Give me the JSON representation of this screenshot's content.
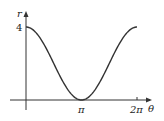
{
  "chart_data": {
    "type": "line",
    "title": "",
    "function": "r = 2 + 2cos(theta)",
    "xlabel": "θ",
    "ylabel": "r",
    "x_ticks": [
      {
        "value": 3.14159,
        "label": "π"
      },
      {
        "value": 6.28319,
        "label": "2π"
      }
    ],
    "y_ticks": [
      {
        "value": 4,
        "label": "4"
      }
    ],
    "xlim": [
      0,
      6.28319
    ],
    "ylim": [
      0,
      4
    ],
    "grid": false,
    "legend": null,
    "x": [
      0,
      0.785,
      1.571,
      2.356,
      3.142,
      3.927,
      4.712,
      5.498,
      6.283
    ],
    "values": [
      4,
      3.414,
      2,
      0.586,
      0,
      0.586,
      2,
      3.414,
      4
    ],
    "color": "#333333"
  }
}
